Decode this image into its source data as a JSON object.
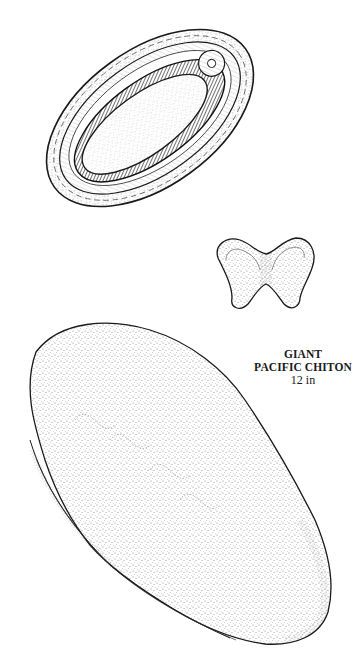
{
  "caption": {
    "line1": "GIANT",
    "line2": "PACIFIC CHITON",
    "size": "12 in"
  },
  "illustrations": [
    {
      "name": "ventral-view",
      "description": "Underside of chiton showing girdle, foot and gills"
    },
    {
      "name": "shell-valve",
      "description": "Single butterfly-shaped shell plate"
    },
    {
      "name": "dorsal-view",
      "description": "Stippled top view of chiton"
    }
  ],
  "colors": {
    "ink": "#1a1a1a",
    "paper": "#ffffff"
  }
}
